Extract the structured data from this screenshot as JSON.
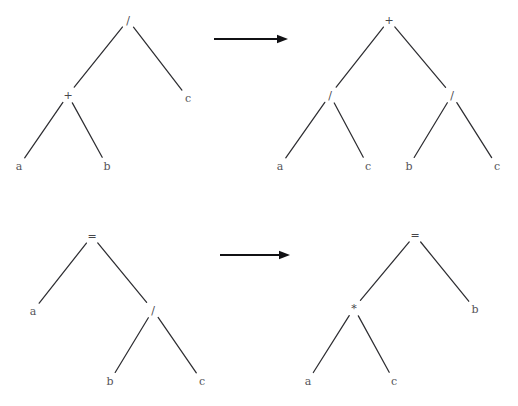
{
  "figure": {
    "background_color": "#ffffff",
    "line_color": "#2e2e32",
    "text_color": "#56565a",
    "arrow_color": "#111114",
    "rows": [
      {
        "name": "distribute-division-over-addition",
        "arrow": {
          "label": "",
          "x1": 214,
          "y1": 39,
          "x2": 288,
          "y2": 39
        }
      },
      {
        "name": "multiply-both-sides",
        "arrow": {
          "label": "",
          "x1": 220,
          "y1": 255,
          "x2": 290,
          "y2": 255
        }
      }
    ],
    "trees": [
      {
        "name": "tree-source-division",
        "nodes": [
          {
            "id": "t1n0",
            "label": "/",
            "x": 128,
            "y": 20,
            "kind": "operator"
          },
          {
            "id": "t1n1",
            "label": "+",
            "x": 68,
            "y": 95,
            "kind": "operator"
          },
          {
            "id": "t1n2",
            "label": "c",
            "x": 188,
            "y": 98,
            "kind": "leaf"
          },
          {
            "id": "t1n3",
            "label": "a",
            "x": 19,
            "y": 166,
            "kind": "leaf"
          },
          {
            "id": "t1n4",
            "label": "b",
            "x": 107,
            "y": 166,
            "kind": "leaf"
          }
        ],
        "edges": [
          {
            "from": "t1n0",
            "to": "t1n1"
          },
          {
            "from": "t1n0",
            "to": "t1n2"
          },
          {
            "from": "t1n1",
            "to": "t1n3"
          },
          {
            "from": "t1n1",
            "to": "t1n4"
          }
        ]
      },
      {
        "name": "tree-result-addition",
        "nodes": [
          {
            "id": "t2n0",
            "label": "+",
            "x": 389,
            "y": 20,
            "kind": "operator"
          },
          {
            "id": "t2n1",
            "label": "/",
            "x": 330,
            "y": 95,
            "kind": "operator"
          },
          {
            "id": "t2n2",
            "label": "/",
            "x": 452,
            "y": 95,
            "kind": "operator"
          },
          {
            "id": "t2n3",
            "label": "a",
            "x": 280,
            "y": 166,
            "kind": "leaf"
          },
          {
            "id": "t2n4",
            "label": "c",
            "x": 368,
            "y": 166,
            "kind": "leaf"
          },
          {
            "id": "t2n5",
            "label": "b",
            "x": 409,
            "y": 166,
            "kind": "leaf"
          },
          {
            "id": "t2n6",
            "label": "c",
            "x": 497,
            "y": 166,
            "kind": "leaf"
          }
        ],
        "edges": [
          {
            "from": "t2n0",
            "to": "t2n1"
          },
          {
            "from": "t2n0",
            "to": "t2n2"
          },
          {
            "from": "t2n1",
            "to": "t2n3"
          },
          {
            "from": "t2n1",
            "to": "t2n4"
          },
          {
            "from": "t2n2",
            "to": "t2n5"
          },
          {
            "from": "t2n2",
            "to": "t2n6"
          }
        ]
      },
      {
        "name": "tree-source-equality",
        "nodes": [
          {
            "id": "t3n0",
            "label": "=",
            "x": 92,
            "y": 236,
            "kind": "operator"
          },
          {
            "id": "t3n1",
            "label": "a",
            "x": 33,
            "y": 311,
            "kind": "leaf"
          },
          {
            "id": "t3n2",
            "label": "/",
            "x": 153,
            "y": 310,
            "kind": "operator"
          },
          {
            "id": "t3n3",
            "label": "b",
            "x": 110,
            "y": 381,
            "kind": "leaf"
          },
          {
            "id": "t3n4",
            "label": "c",
            "x": 202,
            "y": 381,
            "kind": "leaf"
          }
        ],
        "edges": [
          {
            "from": "t3n0",
            "to": "t3n1"
          },
          {
            "from": "t3n0",
            "to": "t3n2"
          },
          {
            "from": "t3n2",
            "to": "t3n3"
          },
          {
            "from": "t3n2",
            "to": "t3n4"
          }
        ]
      },
      {
        "name": "tree-result-equality",
        "nodes": [
          {
            "id": "t4n0",
            "label": "=",
            "x": 415,
            "y": 235,
            "kind": "operator"
          },
          {
            "id": "t4n1",
            "label": "*",
            "x": 354,
            "y": 308,
            "kind": "operator"
          },
          {
            "id": "t4n2",
            "label": "b",
            "x": 475,
            "y": 309,
            "kind": "leaf"
          },
          {
            "id": "t4n3",
            "label": "a",
            "x": 308,
            "y": 381,
            "kind": "leaf"
          },
          {
            "id": "t4n4",
            "label": "c",
            "x": 394,
            "y": 381,
            "kind": "leaf"
          }
        ],
        "edges": [
          {
            "from": "t4n0",
            "to": "t4n1"
          },
          {
            "from": "t4n0",
            "to": "t4n2"
          },
          {
            "from": "t4n1",
            "to": "t4n3"
          },
          {
            "from": "t4n1",
            "to": "t4n4"
          }
        ]
      }
    ]
  }
}
